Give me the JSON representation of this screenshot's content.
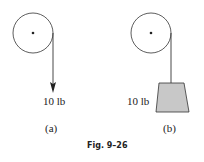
{
  "figure": {
    "caption": "Fig. 9–26",
    "panels": [
      {
        "id": "a",
        "label": "(a)",
        "force_label": "10 lb",
        "load": "force-arrow"
      },
      {
        "id": "b",
        "label": "(b)",
        "force_label": "10 lb",
        "load": "weight-block"
      }
    ],
    "colors": {
      "line": "#333333",
      "block_fill": "#c8c8c8"
    }
  }
}
